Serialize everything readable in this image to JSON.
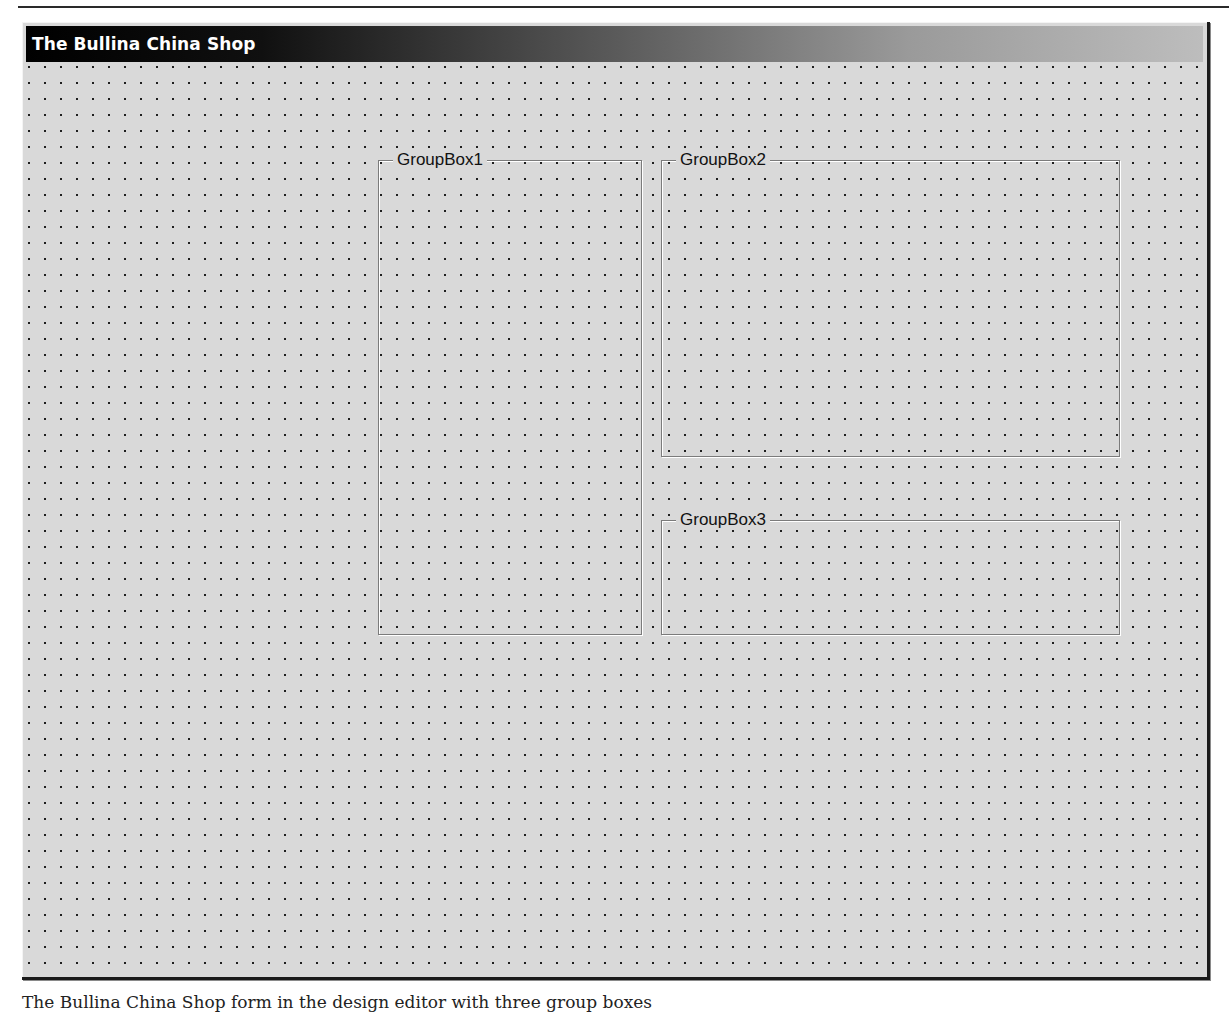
{
  "window": {
    "title": "The Bullina China Shop"
  },
  "form": {
    "grid_spacing_px": 16,
    "background_color": "#d9d9d9",
    "group_boxes": [
      {
        "label": "GroupBox1"
      },
      {
        "label": "GroupBox2"
      },
      {
        "label": "GroupBox3"
      }
    ]
  },
  "caption": {
    "text": "The Bullina China Shop form in the design editor with three group boxes"
  }
}
